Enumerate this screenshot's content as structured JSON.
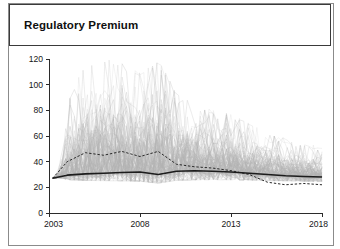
{
  "panel": {
    "title": "Regulatory Premium"
  },
  "chart_data": {
    "type": "line",
    "title": "Regulatory Premium",
    "xlabel": "",
    "ylabel": "",
    "xlim": [
      2003,
      2018
    ],
    "ylim": [
      0,
      120
    ],
    "grid": false,
    "legend": null,
    "x_ticks": [
      "2003",
      "2008",
      "2013",
      "2018"
    ],
    "x_tick_values": [
      2003,
      2008,
      2013,
      2018
    ],
    "y_ticks": [
      "0",
      "20",
      "40",
      "60",
      "80",
      "100",
      "120"
    ],
    "y_tick_values": [
      0,
      20,
      40,
      60,
      80,
      100,
      120
    ],
    "series": [
      {
        "name": "median",
        "style": "solid-thick-dark",
        "x": [
          2003.2,
          2004.0,
          2005.0,
          2006.0,
          2007.0,
          2008.0,
          2009.0,
          2010.0,
          2011.0,
          2012.0,
          2013.0,
          2014.0,
          2015.0,
          2016.0,
          2017.0,
          2018.0
        ],
        "values": [
          27,
          29.5,
          30.5,
          31.0,
          31.5,
          32.0,
          30.0,
          32.5,
          33.0,
          32.5,
          32.0,
          31.0,
          30.0,
          29.0,
          28.5,
          28.0
        ]
      },
      {
        "name": "mean",
        "style": "dashed-dark",
        "x": [
          2003.2,
          2004.0,
          2005.0,
          2006.0,
          2007.0,
          2008.0,
          2009.0,
          2010.0,
          2011.0,
          2012.0,
          2013.0,
          2014.0,
          2015.0,
          2016.0,
          2017.0,
          2018.0
        ],
        "values": [
          27,
          40,
          47,
          45,
          48,
          44,
          48,
          38,
          36,
          35,
          33,
          30,
          24,
          22,
          23,
          22
        ]
      },
      {
        "name": "simulated-paths",
        "style": "thin-gray-bundle",
        "count": 120,
        "envelope_upper": [
          27,
          85,
          118,
          120,
          118,
          110,
          120,
          95,
          85,
          80,
          78,
          70,
          62,
          58,
          55,
          52
        ],
        "envelope_lower": [
          27,
          22,
          20,
          19,
          18,
          17,
          16,
          18,
          18,
          19,
          19,
          20,
          20,
          21,
          21,
          21
        ],
        "x": [
          2003.2,
          2004.0,
          2005.0,
          2006.0,
          2007.0,
          2008.0,
          2009.0,
          2010.0,
          2011.0,
          2012.0,
          2013.0,
          2014.0,
          2015.0,
          2016.0,
          2017.0,
          2018.0
        ]
      }
    ]
  }
}
